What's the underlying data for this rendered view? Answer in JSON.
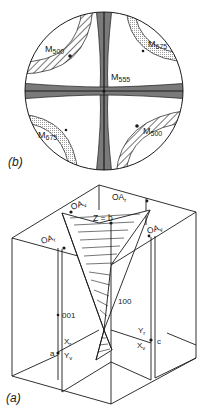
{
  "figure_b": {
    "caption": "(b)",
    "labels": {
      "m500_top_left": "M",
      "m500_top_left_sub": "500",
      "m675_top_right": "M",
      "m675_top_right_sub": "675",
      "m555_center": "M",
      "m555_center_sub": "555",
      "m675_bottom_left": "M",
      "m675_bottom_left_sub": "675",
      "m500_bottom_right": "M",
      "m500_bottom_right_sub": "500"
    },
    "colors": {
      "band_dark": "#7a7a7a",
      "dotted": "#c8c8c8",
      "stroke": "#1a1a1a"
    }
  },
  "figure_a": {
    "caption": "(a)",
    "labels": {
      "oa_v_top_left": "OA",
      "oa_v_top_left_sub": "v",
      "oa_r_top_right": "OA",
      "oa_r_top_right_sub": "r",
      "z_eq_b": "Z = b",
      "oa_v_right": "OA",
      "oa_v_right_sub": "v",
      "oa_r_left": "OA",
      "oa_r_left_sub": "r",
      "dir_100": "100",
      "dir_001": "001",
      "x_r": "X",
      "x_r_sub": "r",
      "y_v": "Y",
      "y_v_sub": "v",
      "axis_a": "a",
      "y_r": "Y",
      "y_r_sub": "r",
      "x_v": "X",
      "x_v_sub": "v",
      "axis_c": "c"
    }
  }
}
